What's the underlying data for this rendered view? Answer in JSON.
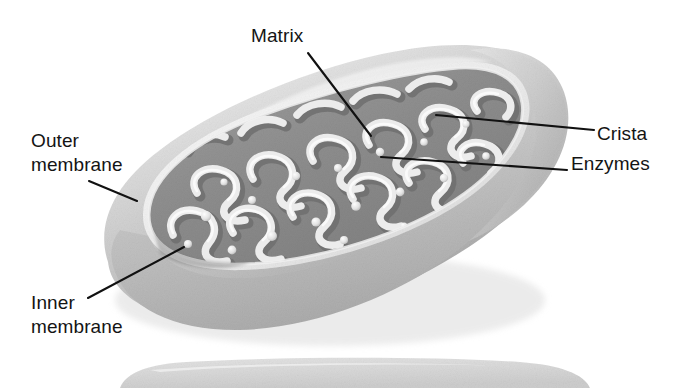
{
  "figure": {
    "style": "grayscale airbrush textbook illustration",
    "width": 684,
    "height": 388,
    "background_color": "#ffffff"
  },
  "labels": {
    "matrix": "Matrix",
    "outer_membrane": "Outer\nmembrane",
    "crista": "Crista",
    "enzymes": "Enzymes",
    "inner_membrane": "Inner\nmembrane"
  },
  "colors": {
    "background": "#ffffff",
    "outer_body_light": "#d2d2d2",
    "outer_body_mid": "#bcbcbc",
    "outer_body_shadow": "#a6a6a6",
    "rim_highlight": "#f2f2f2",
    "matrix_dark": "#8d8d8d",
    "matrix_mid": "#9a9a9a",
    "crista_light": "#e8e8e8",
    "crista_shadow": "#7a7a7a",
    "granule": "#efefef",
    "leader_line": "#111111",
    "text": "#141414"
  },
  "leader_lines": {
    "matrix": {
      "x1": 308,
      "y1": 53,
      "x2": 371,
      "y2": 136
    },
    "outer_membrane": {
      "x1": 89,
      "y1": 181,
      "x2": 137,
      "y2": 201
    },
    "crista": {
      "x1": 594,
      "y1": 130,
      "x2": 436,
      "y2": 115
    },
    "enzymes": {
      "x1": 567,
      "y1": 170,
      "x2": 381,
      "y2": 157
    },
    "inner_membrane": {
      "x1": 88,
      "y1": 298,
      "x2": 184,
      "y2": 247
    }
  },
  "parts": {
    "outer_membrane": "smooth light-gray outer envelope of the organelle",
    "inner_membrane": "folded membrane lining the interior, forms the cristae",
    "crista": "serpentine infolding of the inner membrane",
    "matrix": "darker gray fluid-filled interior space between cristae",
    "enzymes": "small light spherical granules dotted along the cristae"
  },
  "second_organelle": {
    "visible": true,
    "description": "partial second mitochondrion cropped at the bottom edge of the frame"
  }
}
